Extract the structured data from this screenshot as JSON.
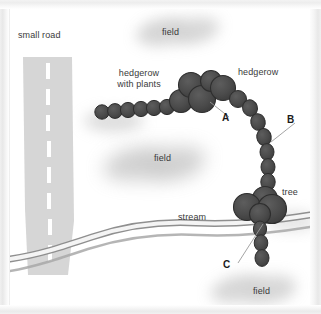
{
  "figure": {
    "type": "schematic-map",
    "background_color": "#ffffff",
    "frame_color": "#ededed"
  },
  "colors": {
    "hedge_fill": "#4d4d4d",
    "hedge_stroke": "#2e2e2e",
    "field_haze": "#bdbdbd",
    "road_fill": "#d6d6d6",
    "road_dash": "#ffffff",
    "stream_fill": "#f0f0f0",
    "stream_edge": "#8c8c8c",
    "text": "#3a3a3a",
    "label_text": "#1b1b1b",
    "leader_line": "#999999"
  },
  "labels": {
    "small_road": "small road",
    "hedgerow_with_plants_line1": "hedgerow",
    "hedgerow_with_plants_line2": "with plants",
    "hedgerow": "hedgerow",
    "tree": "tree",
    "stream": "stream",
    "field_top": "field",
    "field_middle": "field",
    "field_bottom": "field"
  },
  "callouts": [
    {
      "id": "A",
      "label": "A",
      "x": 222,
      "y": 110
    },
    {
      "id": "B",
      "label": "B",
      "x": 287,
      "y": 112
    },
    {
      "id": "C",
      "label": "C",
      "x": 223,
      "y": 258
    }
  ],
  "features": {
    "road": {
      "name": "small road",
      "orientation": "vertical",
      "dash_count": 7
    },
    "hedgerow_chain": {
      "name": "hedgerow",
      "description": "chain of circular canopy symbols running west to east then curving south",
      "small_circle_count": 7,
      "large_circle_count": 6,
      "vertical_chain_count": 9
    },
    "tree_cluster": {
      "name": "tree",
      "circle_count": 4
    },
    "stream": {
      "name": "stream",
      "orientation": "west-east, sinuous"
    },
    "fields": {
      "count": 3,
      "label": "field"
    }
  }
}
